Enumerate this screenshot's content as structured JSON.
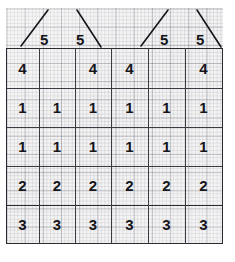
{
  "document": {
    "kind": "hand-drawn-grid-table",
    "title": "Hand-drawn table on graph paper",
    "paper": {
      "background_color": "#f2f2f2",
      "minor_grid_color": "#46465a",
      "major_grid_color": "#46465a",
      "ink_color": "#15151a",
      "rule_color": "#3a3a42"
    }
  },
  "annotations": {
    "label": "5",
    "marks": [
      {
        "id": "five-1",
        "value": "5",
        "slash": "ascending",
        "column": 1
      },
      {
        "id": "five-2",
        "value": "5",
        "slash": "descending",
        "column": 2
      },
      {
        "id": "five-3",
        "value": "5",
        "slash": "ascending",
        "column": 4
      },
      {
        "id": "five-4",
        "value": "5",
        "slash": "descending",
        "column": 5
      }
    ]
  },
  "table": {
    "column_count": 6,
    "row_count": 5,
    "rows": [
      {
        "id": "row-4",
        "label": "4",
        "cells": [
          "4",
          "",
          "4",
          "4",
          "",
          "4"
        ]
      },
      {
        "id": "row-1a",
        "label": "1",
        "cells": [
          "1",
          "1",
          "1",
          "1",
          "1",
          "1"
        ]
      },
      {
        "id": "row-1b",
        "label": "1",
        "cells": [
          "1",
          "1",
          "1",
          "1",
          "1",
          "1"
        ]
      },
      {
        "id": "row-2",
        "label": "2",
        "cells": [
          "2",
          "2",
          "2",
          "2",
          "2",
          "2"
        ]
      },
      {
        "id": "row-3",
        "label": "3",
        "cells": [
          "3",
          "3",
          "3",
          "3",
          "3",
          "3"
        ]
      }
    ]
  }
}
